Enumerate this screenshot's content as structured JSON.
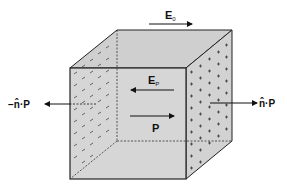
{
  "diagram": {
    "colors": {
      "face_front": "#d6d6d6",
      "face_top": "#cfcfcf",
      "face_side": "#d2d2d2",
      "edge": "#222222",
      "charge": "#555555",
      "background": "#ffffff"
    },
    "labels": {
      "external_field": "E",
      "external_field_sub": "0",
      "polarization_field": "E",
      "polarization_field_sub": "P",
      "polarization": "P",
      "left_surface_charge": "−n̂·P",
      "right_surface_charge": "n̂·P"
    },
    "charges": {
      "left_face_sign": "−",
      "right_face_sign": "+"
    },
    "arrows": [
      {
        "id": "external-field",
        "direction": "right"
      },
      {
        "id": "polarization-field",
        "direction": "left"
      },
      {
        "id": "polarization",
        "direction": "right"
      },
      {
        "id": "left-normal",
        "direction": "left"
      },
      {
        "id": "right-normal",
        "direction": "right"
      }
    ]
  }
}
